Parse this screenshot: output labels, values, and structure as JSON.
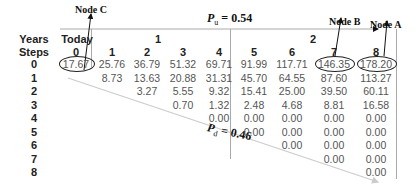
{
  "annotations": {
    "node_c": "Node C",
    "node_b": "Node B",
    "node_a": "Node A",
    "p_up_symbol": "P",
    "p_up_sub": "u",
    "p_up_value": " = 0.54",
    "p_down_symbol": "P",
    "p_down_sub": "d",
    "p_down_value": " = 0.46"
  },
  "header": {
    "years_label": "Years",
    "steps_label": "Steps",
    "years": [
      "Today",
      "1",
      "2"
    ],
    "steps": [
      "0",
      "1",
      "2",
      "3",
      "4",
      "5",
      "6",
      "7",
      "8"
    ]
  },
  "rows": [
    {
      "label": "0",
      "cells": [
        "17.67",
        "25.76",
        "36.79",
        "51.32",
        "69.71",
        "91.99",
        "117.71",
        "146.35",
        "178.20"
      ]
    },
    {
      "label": "1",
      "cells": [
        "",
        "8.73",
        "13.63",
        "20.88",
        "31.31",
        "45.70",
        "64.55",
        "87.60",
        "113.27"
      ]
    },
    {
      "label": "2",
      "cells": [
        "",
        "",
        "3.27",
        "5.55",
        "9.32",
        "15.41",
        "25.00",
        "39.50",
        "60.11"
      ]
    },
    {
      "label": "3",
      "cells": [
        "",
        "",
        "",
        "0.70",
        "1.32",
        "2.48",
        "4.68",
        "8.81",
        "16.58"
      ]
    },
    {
      "label": "4",
      "cells": [
        "",
        "",
        "",
        "",
        "0.00",
        "0.00",
        "0.00",
        "0.00",
        "0.00"
      ]
    },
    {
      "label": "5",
      "cells": [
        "",
        "",
        "",
        "",
        "",
        "0.00",
        "0.00",
        "0.00",
        "0.00"
      ]
    },
    {
      "label": "6",
      "cells": [
        "",
        "",
        "",
        "",
        "",
        "",
        "0.00",
        "0.00",
        "0.00"
      ]
    },
    {
      "label": "7",
      "cells": [
        "",
        "",
        "",
        "",
        "",
        "",
        "",
        "0.00",
        "0.00"
      ]
    },
    {
      "label": "8",
      "cells": [
        "",
        "",
        "",
        "",
        "",
        "",
        "",
        "",
        "0.00"
      ]
    }
  ],
  "colors": {
    "line": "#aaaaaa",
    "text": "#555555",
    "header_text": "#222222",
    "annotation": "#111111"
  }
}
